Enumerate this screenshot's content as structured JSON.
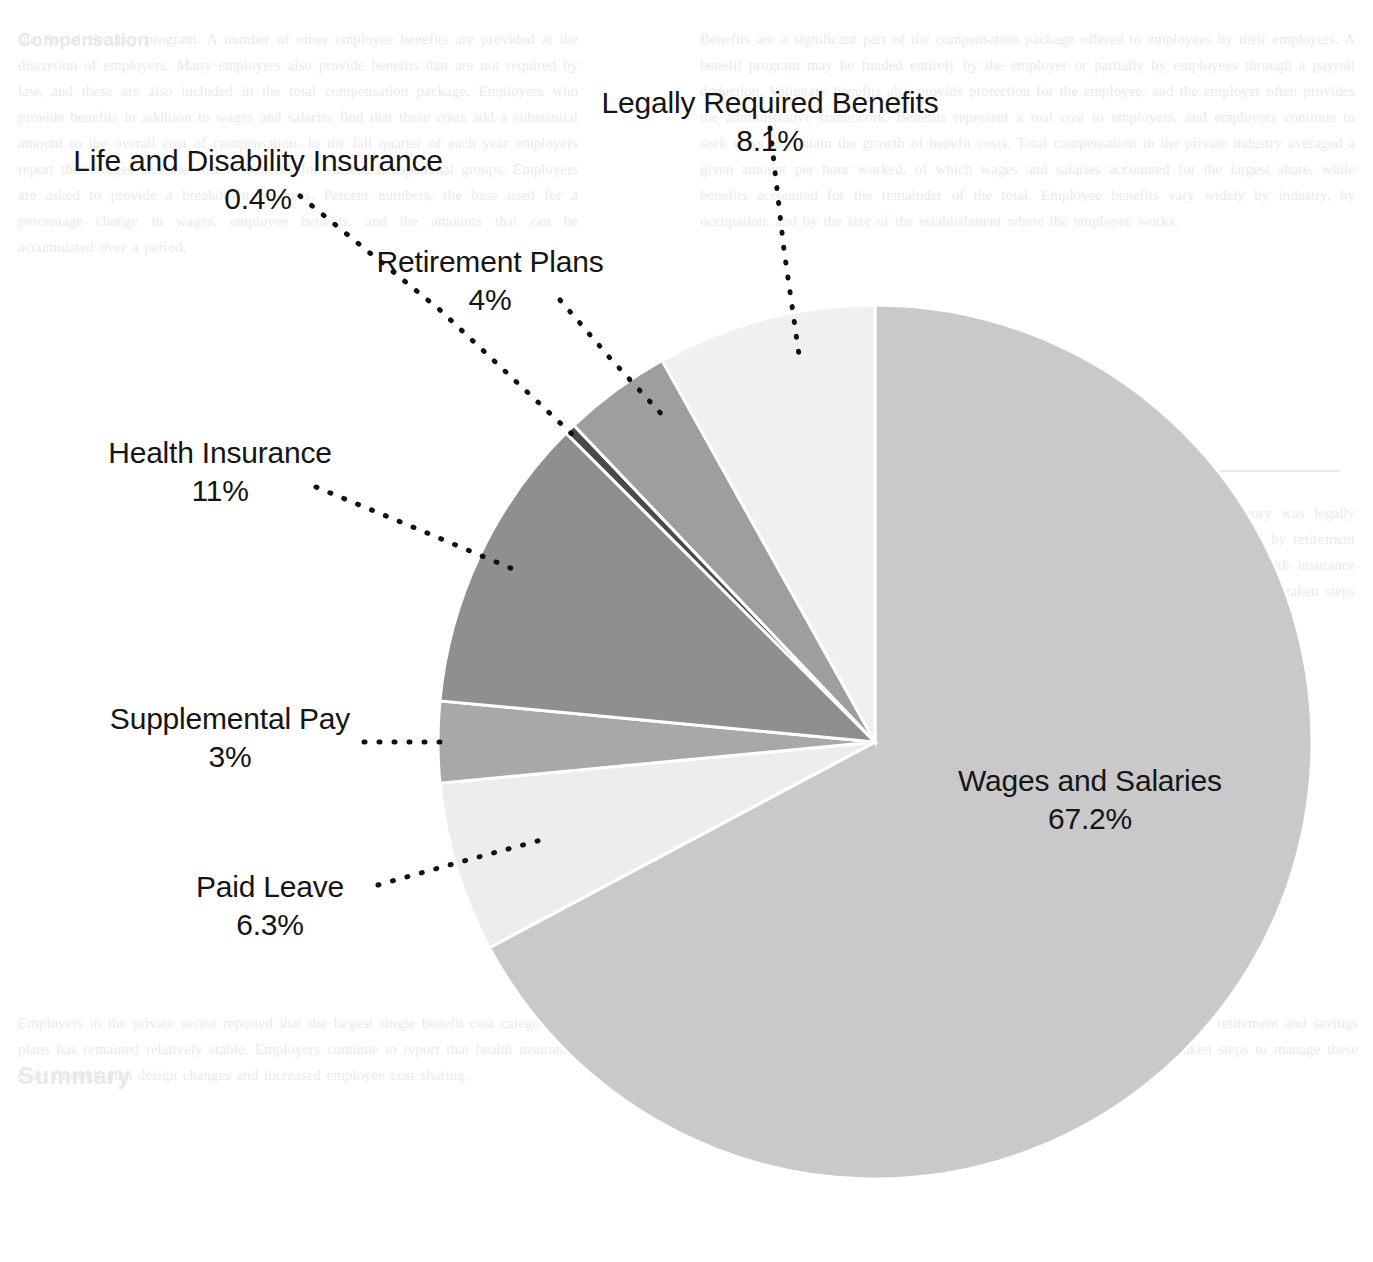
{
  "chart_data": {
    "type": "pie",
    "title": "",
    "subtitle": "",
    "xlabel": "",
    "ylabel": "",
    "legend_position": "labels-with-leader-lines",
    "grid": false,
    "units": "percent",
    "start_angle_deg": 0,
    "direction": "clockwise",
    "categories": [
      "Wages and Salaries",
      "Paid Leave",
      "Supplemental Pay",
      "Health Insurance",
      "Life and Disability Insurance",
      "Retirement Plans",
      "Legally Required Benefits"
    ],
    "values": [
      67.2,
      6.3,
      3.0,
      11.0,
      0.4,
      4.0,
      8.1
    ],
    "value_labels": [
      "67.2%",
      "6.3%",
      "3%",
      "11%",
      "0.4%",
      "4%",
      "8.1%"
    ],
    "colors": [
      "#c9c9c9",
      "#ededed",
      "#a8a8a8",
      "#8f8f8f",
      "#4a4a4a",
      "#9e9e9e",
      "#f0f0f0"
    ],
    "slices": [
      {
        "name": "Wages and Salaries",
        "label": "Wages and Salaries",
        "value": 67.2,
        "value_label": "67.2%",
        "color": "#c9c9c9",
        "label_placement": "inside"
      },
      {
        "name": "Paid Leave",
        "label": "Paid Leave",
        "value": 6.3,
        "value_label": "6.3%",
        "color": "#ededed",
        "label_placement": "outside-left"
      },
      {
        "name": "Supplemental Pay",
        "label": "Supplemental Pay",
        "value": 3.0,
        "value_label": "3%",
        "color": "#a8a8a8",
        "label_placement": "outside-left"
      },
      {
        "name": "Health Insurance",
        "label": "Health Insurance",
        "value": 11.0,
        "value_label": "11%",
        "color": "#8f8f8f",
        "label_placement": "outside-left"
      },
      {
        "name": "Life and Disability Insurance",
        "label": "Life and Disability Insurance",
        "value": 0.4,
        "value_label": "0.4%",
        "color": "#4a4a4a",
        "label_placement": "outside-top-left"
      },
      {
        "name": "Retirement Plans",
        "label": "Retirement Plans",
        "value": 4.0,
        "value_label": "4%",
        "color": "#9e9e9e",
        "label_placement": "outside-top"
      },
      {
        "name": "Legally Required Benefits",
        "label": "Legally Required Benefits",
        "value": 8.1,
        "value_label": "8.1%",
        "color": "#f0f0f0",
        "label_placement": "outside-top"
      }
    ]
  },
  "labels": {
    "legally_required_benefits": {
      "name": "Legally Required Benefits",
      "pct": "8.1%"
    },
    "life_and_disability_insurance": {
      "name": "Life and Disability Insurance",
      "pct": "0.4%"
    },
    "retirement_plans": {
      "name": "Retirement Plans",
      "pct": "4%"
    },
    "health_insurance": {
      "name": "Health Insurance",
      "pct": "11%"
    },
    "supplemental_pay": {
      "name": "Supplemental Pay",
      "pct": "3%"
    },
    "paid_leave": {
      "name": "Paid Leave",
      "pct": "6.3%"
    },
    "wages_and_salaries": {
      "name": "Wages and Salaries",
      "pct": "67.2%"
    }
  },
  "background_page": {
    "heading_top": "Compensation",
    "heading_main": "Benefit Expenditures",
    "heading_bottom": "Summary",
    "column_left": "the Social Security program. A number of other employee benefits are provided at the discretion of employers. Many employers also provide benefits that are not required by law, and these are also included in the total compensation package. Employers who provide benefits in addition to wages and salaries find that these costs add a substantial amount to the overall cost of compensation. In the fall quarter of each year employers report their wages and the cost of benefits for various occupational groups. Employers are asked to provide a breakdown of costs. Percent numbers, the base used for a percentage change in wages, employee benefits, and the amounts that can be accumulated over a period.",
    "column_right": "Benefits are a significant part of the compensation package offered to employees by their employers. A benefit program may be funded entirely by the employer or partially by employees through a payroll deduction. Voluntary benefits also provide protection for the employee, and the employer often provides the administrative framework. Benefits represent a real cost to employers, and employers continue to seek ways to contain the growth of benefit costs. Total compensation in the private industry averaged a given amount per hour worked, of which wages and salaries accounted for the largest share, while benefits accounted for the remainder of the total. Employee benefits vary widely by industry, by occupation, and by the size of the establishment where the employee works.",
    "column_bottom": "Employers in the private sector reported that the largest single benefit cost category was legally required benefits, followed by paid leave and insurance benefits. The share represented by retirement and savings plans has remained relatively stable. Employers continue to report that health insurance costs represent the most rapidly growing component of the benefit package, and many have taken steps to manage these costs through plan design changes and increased employee cost sharing."
  }
}
